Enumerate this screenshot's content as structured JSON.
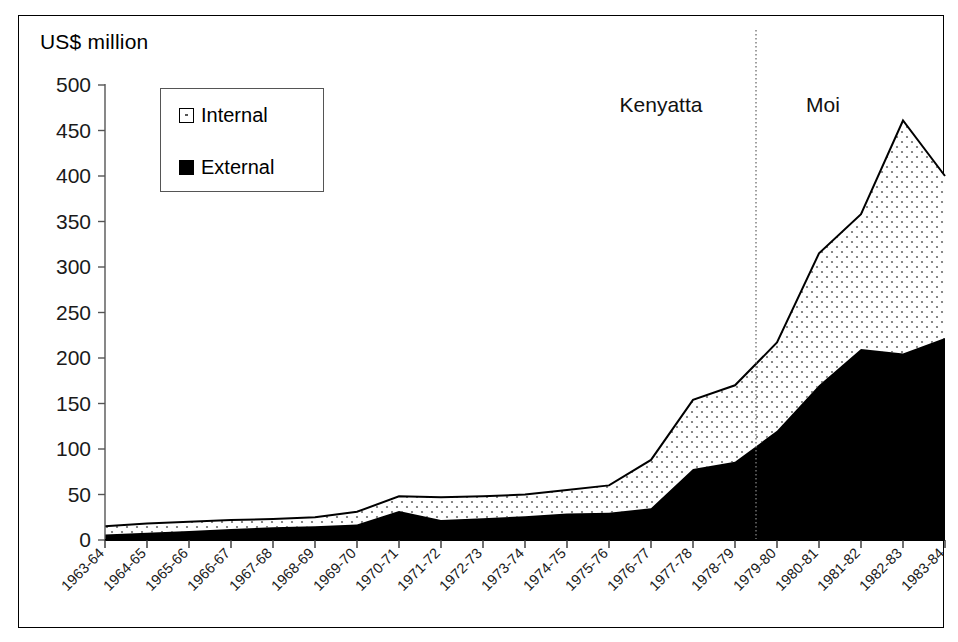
{
  "axis_title": "US$ million",
  "legend": {
    "position": "top-left-inside",
    "items": [
      {
        "label": "Internal",
        "swatch": "internal-pattern-swatch",
        "color": "#ffffff",
        "pattern": "dotted"
      },
      {
        "label": "External",
        "swatch": "external-solid-swatch",
        "color": "#000000",
        "pattern": "solid"
      }
    ]
  },
  "annotations": [
    {
      "name": "kenyatta-label",
      "text": "Kenyatta",
      "x_category": "1976-77"
    },
    {
      "name": "moi-label",
      "text": "Moi",
      "x_category": "1980-81"
    },
    {
      "name": "era-divider",
      "text": "",
      "between": [
        "1978-79",
        "1979-80"
      ],
      "style": "dotted-vertical"
    }
  ],
  "chart_data": {
    "type": "area",
    "stacked": true,
    "title": "",
    "subtitle": "",
    "xlabel": "",
    "ylabel": "US$ million",
    "ylim": [
      0,
      500
    ],
    "ytick_step": 50,
    "yticks": [
      "0",
      "50",
      "100",
      "150",
      "200",
      "250",
      "300",
      "350",
      "400",
      "450",
      "500"
    ],
    "grid": false,
    "legend_position": "top-left",
    "categories": [
      "1963-64",
      "1964-65",
      "1965-66",
      "1966-67",
      "1967-68",
      "1968-69",
      "1969-70",
      "1970-71",
      "1971-72",
      "1972-73",
      "1973-74",
      "1974-75",
      "1975-76",
      "1976-77",
      "1977-78",
      "1978-79",
      "1979-80",
      "1980-81",
      "1981-82",
      "1982-83",
      "1983-84"
    ],
    "series": [
      {
        "name": "External",
        "color": "#000000",
        "pattern": "solid",
        "values": [
          6,
          8,
          10,
          12,
          14,
          15,
          17,
          32,
          22,
          24,
          26,
          29,
          30,
          35,
          78,
          86,
          120,
          170,
          210,
          205,
          222
        ]
      },
      {
        "name": "Internal",
        "color": "#ffffff",
        "pattern": "dotted",
        "values": [
          9,
          10,
          10,
          10,
          9,
          10,
          14,
          16,
          25,
          24,
          24,
          26,
          30,
          53,
          76,
          84,
          97,
          145,
          148,
          256,
          178
        ]
      }
    ],
    "totals": [
      15,
      18,
      20,
      22,
      23,
      25,
      31,
      48,
      47,
      48,
      50,
      55,
      60,
      88,
      154,
      170,
      217,
      315,
      358,
      461,
      400
    ]
  }
}
